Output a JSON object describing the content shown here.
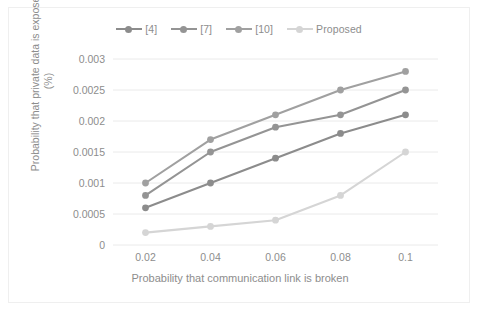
{
  "chart_data": {
    "type": "line",
    "title": "",
    "xlabel": "Probability that communication link is broken",
    "ylabel": "Probability that private data is exposed (%)",
    "ylabel_line1": "Probability that private data is exposed",
    "ylabel_line2": "(%)",
    "x": [
      0.02,
      0.04,
      0.06,
      0.08,
      0.1
    ],
    "categories": [
      "0.02",
      "0.04",
      "0.06",
      "0.08",
      "0.1"
    ],
    "xlim": [
      0.01,
      0.11
    ],
    "ylim": [
      0,
      0.003
    ],
    "yticks": [
      0,
      0.0005,
      0.001,
      0.0015,
      0.002,
      0.0025,
      0.003
    ],
    "ytick_labels": [
      "0",
      "0.0005",
      "0.001",
      "0.0015",
      "0.002",
      "0.0025",
      "0.003"
    ],
    "grid": "horizontal",
    "legend_position": "top-center",
    "series": [
      {
        "name": "[4]",
        "values": [
          0.0006,
          0.001,
          0.0014,
          0.0018,
          0.0021
        ],
        "color": "#8c8c8c"
      },
      {
        "name": "[7]",
        "values": [
          0.0008,
          0.0015,
          0.0019,
          0.0021,
          0.0025
        ],
        "color": "#949494"
      },
      {
        "name": "[10]",
        "values": [
          0.001,
          0.0017,
          0.0021,
          0.0025,
          0.0028
        ],
        "color": "#a0a0a0"
      },
      {
        "name": "Proposed",
        "values": [
          0.0002,
          0.0003,
          0.0004,
          0.0008,
          0.0015
        ],
        "color": "#d5d5d5"
      }
    ]
  },
  "legend": {
    "items": [
      {
        "label": "[4]"
      },
      {
        "label": "[7]"
      },
      {
        "label": "[10]"
      },
      {
        "label": "Proposed"
      }
    ]
  },
  "axes": {
    "y_title_line1": "Probability that private data is exposed",
    "y_title_line2": "(%)",
    "x_title": "Probability that communication link is broken"
  },
  "colors": {
    "gridline": "#eaeaea",
    "border": "#efefef",
    "text": "#8d8d8d",
    "background": "#ffffff"
  }
}
